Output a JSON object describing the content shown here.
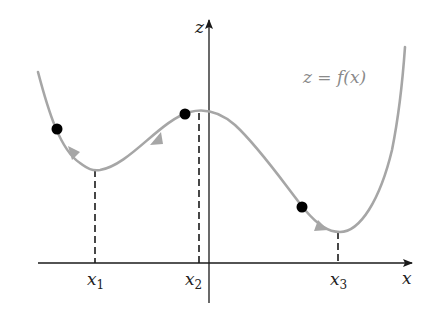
{
  "figure": {
    "curve_label": "z = f(x)",
    "axes": {
      "x_label": "x",
      "z_label": "z"
    },
    "critical_points": [
      {
        "label": "x",
        "subscript": "1",
        "kind": "local minimum"
      },
      {
        "label": "x",
        "subscript": "2",
        "kind": "local maximum"
      },
      {
        "label": "x",
        "subscript": "3",
        "kind": "global minimum"
      }
    ],
    "starting_points": [
      {
        "position": "left slope",
        "descends_to": "x1"
      },
      {
        "position": "near local maximum",
        "descends_to": "x1"
      },
      {
        "position": "right slope",
        "descends_to": "x3"
      }
    ],
    "colors": {
      "curve": "#a6a6a6",
      "axes": "#1a1a1a",
      "points": "#000000",
      "equation_text": "#8a8a8a"
    }
  }
}
